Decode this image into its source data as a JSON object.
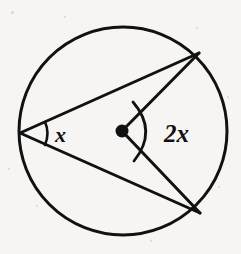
{
  "figure": {
    "background_color": "#f6f5f3",
    "stroke_color": "#111111",
    "stroke_width": 3
  },
  "circle": {
    "name": "circle-outline",
    "cx": 123,
    "cy": 131,
    "r": 104
  },
  "center_point": {
    "name": "center-dot",
    "cx": 122,
    "cy": 131,
    "r": 6.5,
    "fill": "#111111"
  },
  "points": {
    "inscribed_vertex": {
      "x": 20,
      "y": 133
    },
    "upper_right": {
      "x": 199,
      "y": 53
    },
    "lower_right": {
      "x": 200,
      "y": 213
    }
  },
  "chords": [
    {
      "name": "chord-vertex-to-upper-right",
      "x1": 20,
      "y1": 133,
      "x2": 199,
      "y2": 53
    },
    {
      "name": "chord-vertex-to-lower-right",
      "x1": 20,
      "y1": 133,
      "x2": 200,
      "y2": 213
    }
  ],
  "radii": [
    {
      "name": "radius-center-to-upper-right",
      "x1": 122,
      "y1": 131,
      "x2": 199,
      "y2": 53
    },
    {
      "name": "radius-center-to-lower-right",
      "x1": 122,
      "y1": 131,
      "x2": 200,
      "y2": 213
    }
  ],
  "angle_arcs": {
    "inscribed": {
      "name": "inscribed-angle-arc",
      "path": "M 45 122 Q 50 133 45 145"
    },
    "central": {
      "name": "central-angle-arc",
      "path": "M 133 102 Q 158 131 134 161"
    }
  },
  "labels": {
    "inscribed_angle": {
      "text": "x",
      "x": 55,
      "y": 142,
      "font_size": 22
    },
    "central_angle": {
      "text": "2x",
      "prefix": "2",
      "variable": "x",
      "x": 164,
      "y": 142,
      "font_size": 25
    }
  },
  "speckles": [
    {
      "x": 11,
      "y": 11,
      "size": 3
    },
    {
      "x": 196,
      "y": 27,
      "size": 2
    },
    {
      "x": 36,
      "y": 205,
      "size": 2
    },
    {
      "x": 218,
      "y": 186,
      "size": 2
    },
    {
      "x": 150,
      "y": 240,
      "size": 2
    },
    {
      "x": 64,
      "y": 16,
      "size": 2
    },
    {
      "x": 227,
      "y": 96,
      "size": 2
    },
    {
      "x": 8,
      "y": 168,
      "size": 2
    }
  ]
}
